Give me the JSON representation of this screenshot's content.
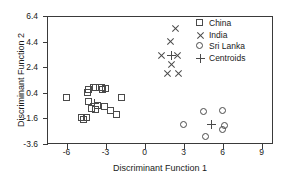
{
  "chart_data": {
    "type": "scatter",
    "title": "",
    "xlabel": "Discriminant Function 1",
    "ylabel": "Discriminant Function 2",
    "xlim": [
      -7.5,
      9.8
    ],
    "ylim": [
      -3.6,
      6.4
    ],
    "xticks": [
      -6,
      -3,
      0,
      3,
      6,
      9
    ],
    "xticklabels": [
      "-6",
      "-3",
      "0",
      "3",
      "6",
      "9"
    ],
    "yticks": [
      -3.6,
      -1.6,
      0.4,
      2.4,
      4.4,
      6.4
    ],
    "yticklabels": [
      "-3.6",
      "-1.6",
      "0.4",
      "2.4",
      "4.4",
      "6.4"
    ],
    "grid": false,
    "legend_position": "top-right",
    "series": [
      {
        "name": "China",
        "marker": "square",
        "points": [
          [
            -5.95,
            0.0
          ],
          [
            -4.8,
            -1.55
          ],
          [
            -4.62,
            -1.72
          ],
          [
            -4.42,
            -1.6
          ],
          [
            -4.35,
            0.35
          ],
          [
            -4.3,
            0.62
          ],
          [
            -4.25,
            -0.35
          ],
          [
            -4.05,
            -0.85
          ],
          [
            -3.85,
            0.75
          ],
          [
            -3.72,
            0.78
          ],
          [
            -3.7,
            -0.95
          ],
          [
            -3.55,
            -0.62
          ],
          [
            -3.3,
            0.8
          ],
          [
            -3.2,
            0.6
          ],
          [
            -3.05,
            -0.72
          ],
          [
            -2.98,
            0.72
          ],
          [
            -2.6,
            -1.0
          ],
          [
            -2.15,
            -1.3
          ],
          [
            -1.75,
            0.0
          ]
        ]
      },
      {
        "name": "India",
        "marker": "cross",
        "points": [
          [
            2.45,
            5.35
          ],
          [
            2.05,
            4.4
          ],
          [
            1.35,
            3.25
          ],
          [
            2.55,
            3.25
          ],
          [
            2.08,
            2.55
          ],
          [
            1.8,
            1.9
          ],
          [
            2.65,
            1.9
          ]
        ]
      },
      {
        "name": "Sri Lanka",
        "marker": "circle",
        "points": [
          [
            4.55,
            -1.08
          ],
          [
            6.05,
            -1.05
          ],
          [
            3.02,
            -2.12
          ],
          [
            4.72,
            -3.05
          ],
          [
            6.0,
            -2.48
          ],
          [
            6.2,
            -2.22
          ]
        ]
      },
      {
        "name": "Centroids",
        "marker": "plus",
        "points": [
          [
            -3.78,
            -0.48
          ],
          [
            2.1,
            3.28
          ],
          [
            5.15,
            -2.1
          ]
        ]
      }
    ]
  },
  "legend": {
    "items": [
      {
        "label": "China",
        "marker": "square"
      },
      {
        "label": "India",
        "marker": "cross"
      },
      {
        "label": "Sri Lanka",
        "marker": "circle"
      },
      {
        "label": "Centroids",
        "marker": "plus"
      }
    ]
  },
  "colors": {
    "axis": "#3a3a3a",
    "marker": "#4a4a4a",
    "background": "#ffffff",
    "text": "#1a1a1a"
  }
}
